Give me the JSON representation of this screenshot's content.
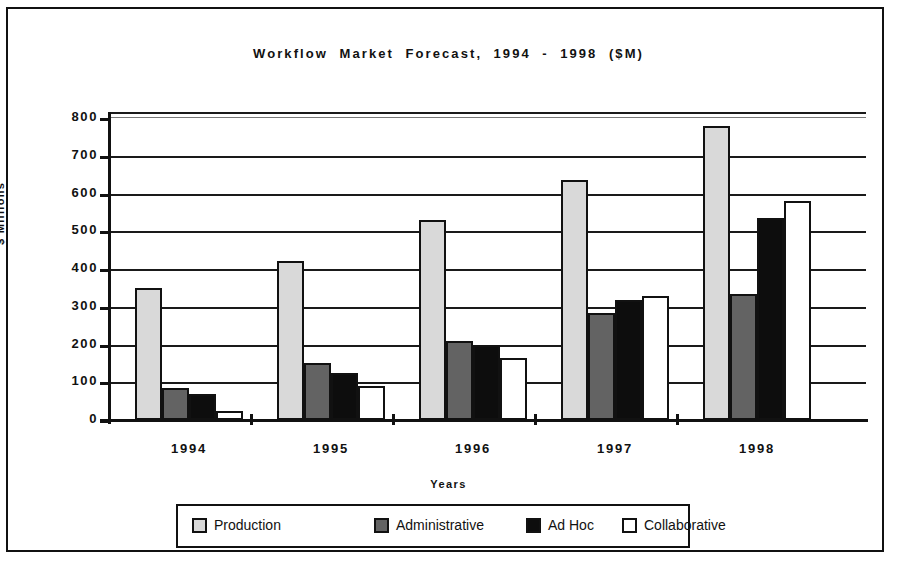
{
  "chart_data": {
    "type": "bar",
    "title": "Workflow  Market  Forecast,  1994  -  1998  ($M)",
    "xlabel": "Years",
    "ylabel": "$  Millions",
    "categories": [
      "1994",
      "1995",
      "1996",
      "1997",
      "1998"
    ],
    "ylim": [
      0,
      800
    ],
    "ytick_step": 100,
    "yticks": [
      "800",
      "700",
      "600",
      "500",
      "400",
      "300",
      "200",
      "100",
      "0"
    ],
    "grid": true,
    "legend_position": "bottom",
    "series": [
      {
        "name": "Production",
        "color": "#d9d9d9",
        "values": [
          350,
          420,
          530,
          635,
          780
        ]
      },
      {
        "name": "Administrative",
        "color": "#636363",
        "values": [
          85,
          150,
          210,
          283,
          335
        ]
      },
      {
        "name": "Ad Hoc",
        "color": "#0d0d0d",
        "values": [
          70,
          125,
          200,
          318,
          535
        ]
      },
      {
        "name": "Collaborative",
        "color": "#ffffff",
        "values": [
          25,
          90,
          163,
          328,
          580
        ]
      }
    ]
  },
  "legend": {
    "items": [
      {
        "label": "Production",
        "swatch": "production"
      },
      {
        "label": "Administrative",
        "swatch": "administrative"
      },
      {
        "label": "Ad Hoc",
        "swatch": "adhoc"
      },
      {
        "label": "Collaborative",
        "swatch": "collaborative"
      }
    ]
  }
}
